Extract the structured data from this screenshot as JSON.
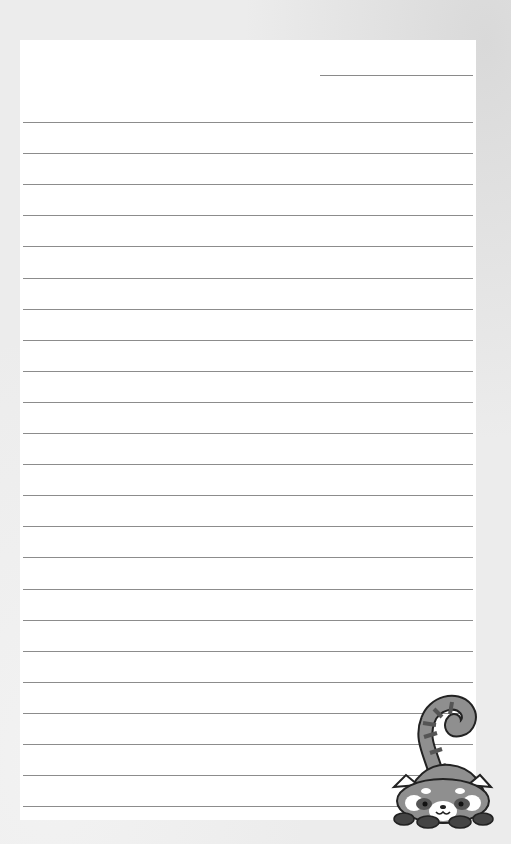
{
  "page": {
    "type": "lined notepaper",
    "background_color": "#ececec",
    "paper_color": "#ffffff",
    "line_color": "#8c8c8c",
    "date_line": true,
    "line_count": 23,
    "line_spacing_px": 31
  },
  "illustration": {
    "name": "red-panda-icon",
    "description": "grayscale cartoon red panda peeking over bottom-right corner with striped tail raised"
  }
}
